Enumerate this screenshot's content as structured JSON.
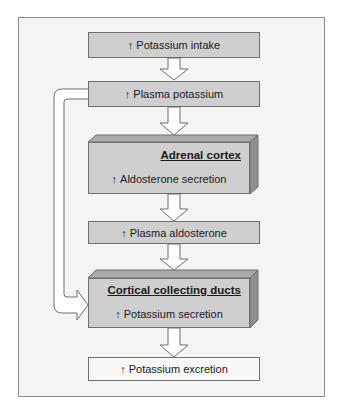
{
  "diagram": {
    "type": "flowchart",
    "arrow_symbol": "↑",
    "colors": {
      "frame_bg": "#f4f4f3",
      "box_fill": "#cfcfcf",
      "box_light_fill": "#f7f7f7",
      "box_top_face": "#a9a9a9",
      "box_side_face": "#8f8f8f",
      "border": "#6e6e6e",
      "arrow_fill": "#ffffff"
    },
    "nodes": [
      {
        "id": "potassium-intake",
        "label": "Potassium intake",
        "indicator": "↑"
      },
      {
        "id": "plasma-potassium",
        "label": "Plasma potassium",
        "indicator": "↑"
      },
      {
        "id": "adrenal-cortex",
        "title": "Adrenal cortex",
        "label": "Aldosterone secretion",
        "indicator": "↑"
      },
      {
        "id": "plasma-aldosterone",
        "label": "Plasma aldosterone",
        "indicator": "↑"
      },
      {
        "id": "cortical-collecting-ducts",
        "title": "Cortical collecting ducts",
        "label": "Potassium secretion",
        "indicator": "↑"
      },
      {
        "id": "potassium-excretion",
        "label": "Potassium excretion",
        "indicator": "↑"
      }
    ],
    "edges": [
      {
        "from": "potassium-intake",
        "to": "plasma-potassium"
      },
      {
        "from": "plasma-potassium",
        "to": "adrenal-cortex"
      },
      {
        "from": "adrenal-cortex",
        "to": "plasma-aldosterone"
      },
      {
        "from": "plasma-aldosterone",
        "to": "cortical-collecting-ducts"
      },
      {
        "from": "plasma-potassium",
        "to": "cortical-collecting-ducts",
        "style": "bypass-left"
      },
      {
        "from": "cortical-collecting-ducts",
        "to": "potassium-excretion"
      }
    ]
  }
}
